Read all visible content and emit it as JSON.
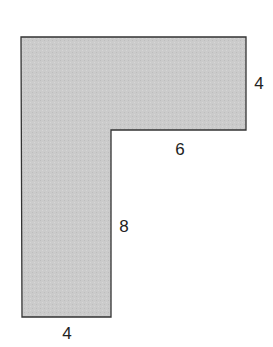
{
  "diagram": {
    "type": "L-shaped polygon",
    "fill_color": "#c9c9c9",
    "stroke_color": "#333333",
    "vertices": [
      [
        21,
        37
      ],
      [
        246,
        37
      ],
      [
        246,
        130
      ],
      [
        111,
        130
      ],
      [
        111,
        317
      ],
      [
        22,
        317
      ]
    ],
    "labels": [
      {
        "id": "right-height",
        "text": "4",
        "x": 259,
        "y": 83
      },
      {
        "id": "inner-top-width",
        "text": "6",
        "x": 180,
        "y": 149
      },
      {
        "id": "inner-height",
        "text": "8",
        "x": 124,
        "y": 226
      },
      {
        "id": "bottom-width",
        "text": "4",
        "x": 67,
        "y": 333
      }
    ]
  }
}
